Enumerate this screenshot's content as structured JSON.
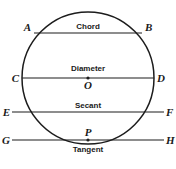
{
  "figure": {
    "type": "geometry-diagram",
    "background_color": "#ffffff",
    "stroke_color": "#1c1c1c"
  },
  "circle": {
    "center_label": "O",
    "center_x": 88,
    "center_y": 78,
    "radius": 66
  },
  "points": {
    "a": "A",
    "b": "B",
    "c": "C",
    "d": "D",
    "e": "E",
    "f": "F",
    "g": "G",
    "h": "H",
    "p": "P",
    "o": "O"
  },
  "segments": [
    {
      "id": "chord",
      "label": "Chord",
      "endpoints": [
        "A",
        "B"
      ],
      "y": 33,
      "x1": 34,
      "x2": 142,
      "label_x": 88,
      "label_y": 29
    },
    {
      "id": "diameter",
      "label": "Diameter",
      "endpoints": [
        "C",
        "D"
      ],
      "y": 78,
      "x1": 22,
      "x2": 154,
      "label_x": 88,
      "label_y": 71
    },
    {
      "id": "secant",
      "label": "Secant",
      "endpoints": [
        "E",
        "F"
      ],
      "y": 112,
      "x1": 12,
      "x2": 164,
      "label_x": 88,
      "label_y": 108
    },
    {
      "id": "tangent",
      "label": "Tangent",
      "endpoints": [
        "G",
        "H"
      ],
      "y": 140,
      "x1": 12,
      "x2": 164,
      "label_x": 88,
      "label_y": 151
    }
  ],
  "labels": {
    "chord": "Chord",
    "diameter": "Diameter",
    "secant": "Secant",
    "tangent": "Tangent"
  }
}
